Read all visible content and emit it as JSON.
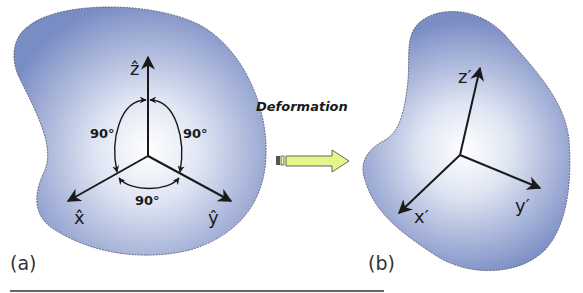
{
  "figure": {
    "panel_a": {
      "label": "(a)",
      "axes": {
        "z": "ẑ",
        "x": "x̂",
        "y": "ŷ"
      },
      "angles": {
        "zx": "90°",
        "zy": "90°",
        "xy": "90°"
      }
    },
    "transition": {
      "label": "Deformation",
      "arrow_color": "#e6f58a"
    },
    "panel_b": {
      "label": "(b)",
      "axes": {
        "z": "z′",
        "x": "x′",
        "y": "y′"
      }
    },
    "colors": {
      "body_center": "#ffffff",
      "body_edge": "#7f8fc2",
      "axis": "#1a1a1a",
      "outline": "#555566"
    }
  }
}
